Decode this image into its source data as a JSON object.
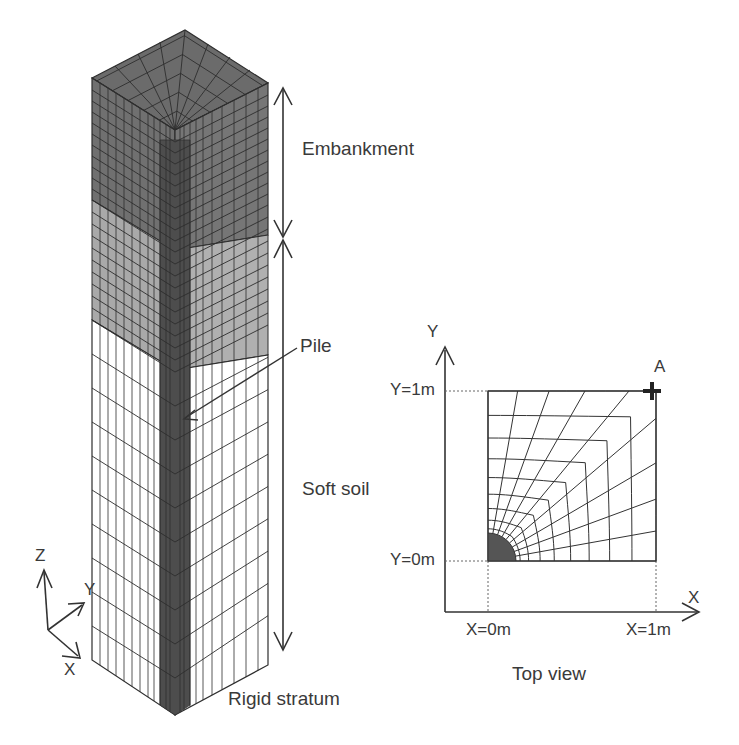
{
  "labels": {
    "embankment": "Embankment",
    "pile": "Pile",
    "soft_soil": "Soft soil",
    "rigid_stratum": "Rigid stratum",
    "top_view": "Top view",
    "axis_z": "Z",
    "axis_y_iso": "Y",
    "axis_x_iso": "X",
    "axis_y_top": "Y",
    "axis_x_top": "X",
    "y_1m": "Y=1m",
    "y_0m": "Y=0m",
    "x_0m": "X=0m",
    "x_1m": "X=1m",
    "point_a": "A"
  },
  "colors": {
    "embankment": "#6e6e6e",
    "transition": "#a8a8a8",
    "soft_soil": "#ffffff",
    "pile": "#4a4a4a",
    "mesh_line": "#2e2e2e",
    "text": "#3a3a3a"
  }
}
